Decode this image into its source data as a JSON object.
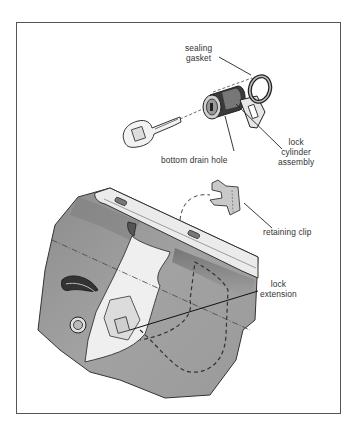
{
  "diagram": {
    "labels": {
      "sealing_gasket": [
        "sealing",
        "gasket"
      ],
      "bottom_drain_hole": "bottom drain hole",
      "lock_cylinder_assembly": [
        "lock",
        "cylinder",
        "assembly"
      ],
      "retaining_clip": "retaining clip",
      "lock_extension": [
        "lock",
        "extension"
      ]
    },
    "components": [
      "key",
      "lock cylinder assembly",
      "sealing gasket",
      "retaining clip",
      "door panel",
      "lock extension"
    ],
    "colors": {
      "frame": "#555555",
      "panel_gray": "#9a9a9a",
      "panel_dark": "#7e7e7e",
      "line": "#222222",
      "label_text": "#333333",
      "part_light": "#e8e8e8"
    }
  }
}
